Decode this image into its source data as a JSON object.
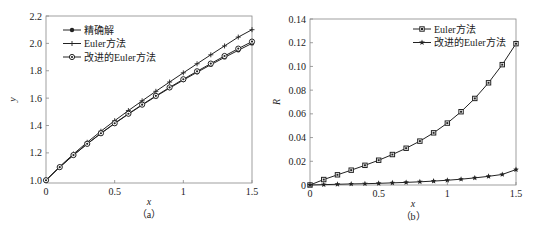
{
  "chart_data": [
    {
      "type": "line",
      "caption": "（a）",
      "title": "",
      "xlabel": "x",
      "ylabel": "y",
      "xlim": [
        0,
        1.5
      ],
      "ylim": [
        0.98,
        2.2
      ],
      "xticks": [
        "0",
        "0.5",
        "1",
        "1.5"
      ],
      "yticks": [
        "1.0",
        "1.2",
        "1.4",
        "1.6",
        "1.8",
        "2.0",
        "2.2"
      ],
      "grid": false,
      "legend_position": "upper left",
      "x": [
        0,
        0.1,
        0.2,
        0.3,
        0.4,
        0.5,
        0.6,
        0.7,
        0.8,
        0.9,
        1.0,
        1.1,
        1.2,
        1.3,
        1.4,
        1.5
      ],
      "series": [
        {
          "name": "精确解",
          "marker": "dot",
          "values": [
            1.0,
            1.0954,
            1.1832,
            1.2649,
            1.3416,
            1.4142,
            1.4832,
            1.5492,
            1.6125,
            1.6733,
            1.7321,
            1.7889,
            1.8439,
            1.8974,
            1.9494,
            2.0
          ]
        },
        {
          "name": "Euler方法",
          "marker": "plus",
          "values": [
            1.0,
            1.1,
            1.1918,
            1.2774,
            1.3582,
            1.4351,
            1.509,
            1.5803,
            1.6498,
            1.7178,
            1.7848,
            1.8509,
            1.9165,
            1.9814,
            2.046,
            2.1
          ]
        },
        {
          "name": "改进的Euler方法",
          "marker": "circle",
          "values": [
            1.0,
            1.0959,
            1.1841,
            1.2662,
            1.3434,
            1.4164,
            1.486,
            1.5525,
            1.6165,
            1.6782,
            1.7379,
            1.796,
            1.8524,
            1.9078,
            1.9617,
            2.013
          ]
        }
      ]
    },
    {
      "type": "line",
      "caption": "（b）",
      "title": "",
      "xlabel": "x",
      "ylabel": "R",
      "xlim": [
        0,
        1.5
      ],
      "ylim": [
        0,
        0.14
      ],
      "xticks": [
        "0",
        "0.5",
        "1",
        "1.5"
      ],
      "yticks": [
        "0",
        "0.02",
        "0.04",
        "0.06",
        "0.08",
        "0.10",
        "0.12",
        "0.14"
      ],
      "grid": false,
      "legend_position": "upper right",
      "x": [
        0,
        0.1,
        0.2,
        0.3,
        0.4,
        0.5,
        0.6,
        0.7,
        0.8,
        0.9,
        1.0,
        1.1,
        1.2,
        1.3,
        1.4,
        1.5
      ],
      "series": [
        {
          "name": "Euler方法",
          "marker": "square",
          "values": [
            0,
            0.0046,
            0.0086,
            0.0125,
            0.0166,
            0.0209,
            0.0257,
            0.031,
            0.037,
            0.044,
            0.0522,
            0.0618,
            0.073,
            0.0862,
            0.1015,
            0.1192
          ]
        },
        {
          "name": "改进的Euler方法",
          "marker": "star",
          "values": [
            0,
            0.0003,
            0.0006,
            0.0009,
            0.0011,
            0.0014,
            0.0018,
            0.0022,
            0.0027,
            0.0033,
            0.004,
            0.0049,
            0.006,
            0.0073,
            0.0089,
            0.013
          ]
        }
      ]
    }
  ],
  "panels": [
    {
      "caption": "（a）",
      "xlabel": "x",
      "ylabel": "y",
      "legend": [
        "精确解",
        "Euler方法",
        "改进的Euler方法"
      ],
      "xticks": [
        "0",
        "0.5",
        "1",
        "1.5"
      ],
      "yticks": [
        "1.0",
        "1.2",
        "1.4",
        "1.6",
        "1.8",
        "2.0",
        "2.2"
      ]
    },
    {
      "caption": "（b）",
      "xlabel": "x",
      "ylabel": "R",
      "legend": [
        "Euler方法",
        "改进的Euler方法"
      ],
      "xticks": [
        "0",
        "0.5",
        "1",
        "1.5"
      ],
      "yticks": [
        "0",
        "0.02",
        "0.04",
        "0.06",
        "0.08",
        "0.10",
        "0.12",
        "0.14"
      ]
    }
  ],
  "colors": {
    "line": "#222222",
    "axis": "#888888"
  }
}
